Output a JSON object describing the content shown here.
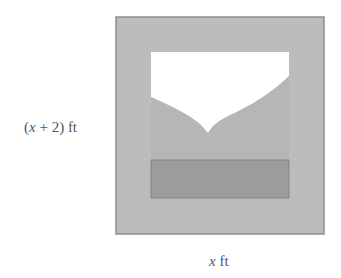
{
  "figure": {
    "side_label": {
      "var": "x",
      "text_before": "(",
      "text_after": " + 2) ft"
    },
    "bottom_label": {
      "var": "x",
      "text_after": " ft"
    },
    "colors": {
      "frame": "#bcbcbc",
      "frame_border": "#8e8e8e",
      "sky": "#ffffff",
      "mountain": "#b6b6b6",
      "ground": "#9c9c9c",
      "ground_border": "#7a7a7a"
    }
  }
}
